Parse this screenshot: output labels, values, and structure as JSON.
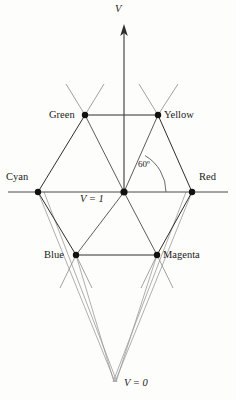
{
  "figure": {
    "background_color": "#fdfdfb",
    "line_color": "#3a3a3a",
    "faint_line_color": "#8d8d8d",
    "vertex_color": "#111111",
    "axis": {
      "label": "V",
      "arrow_direction": "up",
      "top_value_label": "V = 1",
      "bottom_value_label": "V = 0"
    },
    "angle_marker": {
      "label": "60º",
      "value": 60,
      "unit": "degrees"
    },
    "vertices": [
      {
        "name": "green",
        "label": "Green",
        "x": 85,
        "y": 115,
        "label_x": 49,
        "label_y": 110,
        "label_align": "right"
      },
      {
        "name": "yellow",
        "label": "Yellow",
        "x": 158,
        "y": 115,
        "label_x": 163,
        "label_y": 110,
        "label_align": "left"
      },
      {
        "name": "cyan",
        "label": "Cyan",
        "x": 38,
        "y": 192,
        "label_x": 6,
        "label_y": 172,
        "label_align": "left"
      },
      {
        "name": "red",
        "label": "Red",
        "x": 192,
        "y": 192,
        "label_x": 198,
        "label_y": 172,
        "label_align": "left"
      },
      {
        "name": "blue",
        "label": "Blue",
        "x": 76,
        "y": 255,
        "label_x": 42,
        "label_y": 250,
        "label_align": "right"
      },
      {
        "name": "magenta",
        "label": "Magenta",
        "x": 157,
        "y": 255,
        "label_x": 162,
        "label_y": 250,
        "label_align": "left"
      }
    ],
    "center_point": {
      "name": "v-one-center",
      "x": 124,
      "y": 192
    },
    "apex_point": {
      "name": "v-zero-apex",
      "x": 115,
      "y": 382
    }
  },
  "labels": {
    "axis_v": "V",
    "v_equals_one": "V = 1",
    "v_equals_zero": "V = 0",
    "angle": "60º",
    "green": "Green",
    "yellow": "Yellow",
    "cyan": "Cyan",
    "red": "Red",
    "blue": "Blue",
    "magenta": "Magenta"
  }
}
